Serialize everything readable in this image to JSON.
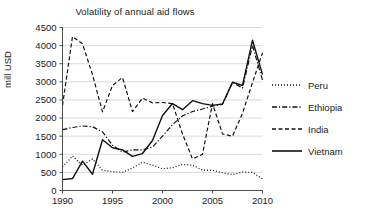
{
  "chart_data": {
    "type": "line",
    "title": "Volatility of annual aid flows",
    "xlabel": "",
    "ylabel": "mill USD",
    "xlim": [
      1990,
      2010
    ],
    "ylim": [
      0,
      4500
    ],
    "ytick_labels": [
      "4500",
      "4000",
      "3500",
      "3000",
      "2500",
      "2000",
      "1500",
      "1000",
      "500",
      "0"
    ],
    "yticks": [
      4500,
      4000,
      3500,
      3000,
      2500,
      2000,
      1500,
      1000,
      500,
      0
    ],
    "xtick_labels": [
      "1990",
      "1995",
      "2000",
      "2005",
      "2010"
    ],
    "xticks": [
      1990,
      1995,
      2000,
      2005,
      2010
    ],
    "grid": "horizontal",
    "legend_position": "right",
    "x": [
      1990,
      1991,
      1992,
      1993,
      1994,
      1995,
      1996,
      1997,
      1998,
      1999,
      2000,
      2001,
      2002,
      2003,
      2004,
      2005,
      2006,
      2007,
      2008,
      2009,
      2010
    ],
    "series": [
      {
        "name": "Peru",
        "style": "dotted",
        "color": "#111111",
        "values": [
          650,
          950,
          700,
          870,
          560,
          520,
          500,
          620,
          780,
          700,
          600,
          630,
          720,
          700,
          560,
          560,
          490,
          440,
          510,
          500,
          320
        ]
      },
      {
        "name": "Ethiopia",
        "style": "dash-dot",
        "color": "#111111",
        "values": [
          1680,
          1740,
          1780,
          1760,
          1620,
          1250,
          1060,
          1120,
          1120,
          1200,
          1500,
          1820,
          2060,
          2180,
          2250,
          2330,
          2380,
          2980,
          2830,
          4000,
          3050
        ]
      },
      {
        "name": "India",
        "style": "dashed",
        "color": "#111111",
        "values": [
          2350,
          4250,
          4050,
          3200,
          2170,
          2900,
          3120,
          2180,
          2550,
          2420,
          2430,
          2400,
          1560,
          870,
          1000,
          2400,
          1560,
          1500,
          2130,
          2980,
          3800
        ]
      },
      {
        "name": "Vietnam",
        "style": "solid",
        "color": "#111111",
        "values": [
          300,
          330,
          810,
          450,
          1400,
          1180,
          1120,
          940,
          1020,
          1380,
          2070,
          2400,
          2230,
          2480,
          2400,
          2350,
          2390,
          2990,
          2900,
          4150,
          3200
        ]
      }
    ]
  },
  "legend": {
    "items": [
      {
        "label": "Peru",
        "swatch": "dotted-line-swatch"
      },
      {
        "label": "Ethiopia",
        "swatch": "dash-dot-line-swatch"
      },
      {
        "label": "India",
        "swatch": "dashed-line-swatch"
      },
      {
        "label": "Vietnam",
        "swatch": "solid-line-swatch"
      }
    ]
  }
}
